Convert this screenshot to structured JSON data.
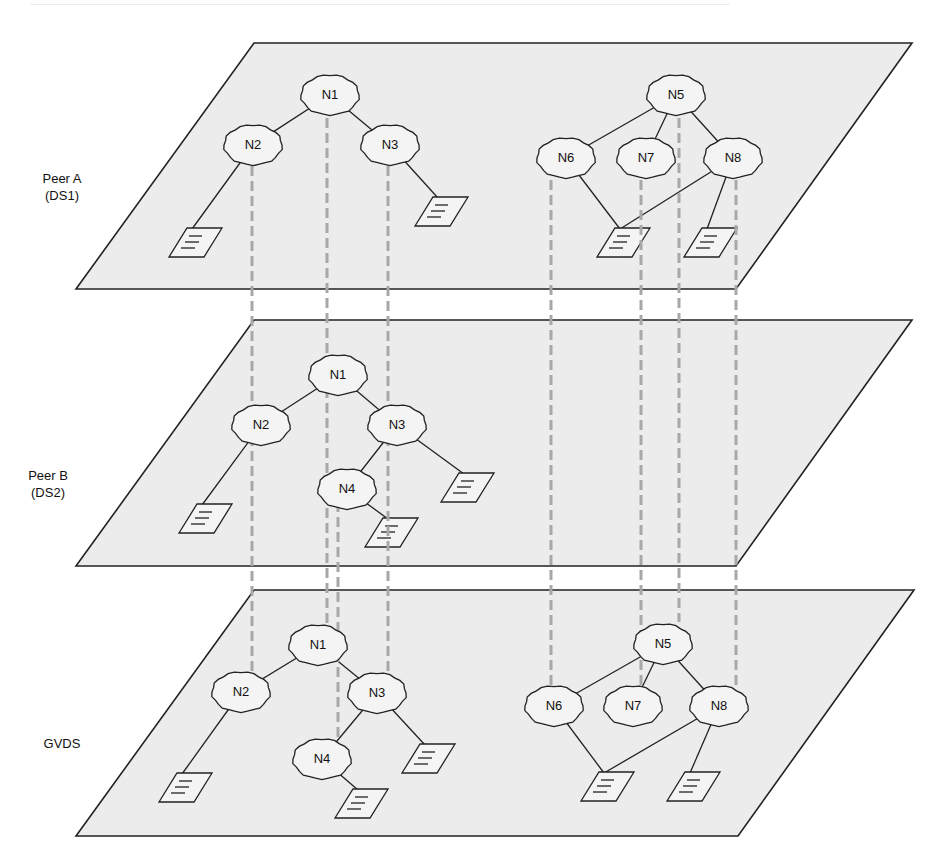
{
  "layers": [
    {
      "id": "peerA",
      "label_line1": "Peer A",
      "label_line2": "(DS1)",
      "plane": {
        "top": 43,
        "bottom": 289,
        "top_left": 254,
        "top_right": 912,
        "bottom_left": 76,
        "bottom_right": 736
      },
      "nodes": [
        {
          "id": "N1",
          "label": "N1",
          "x": 330,
          "y": 95
        },
        {
          "id": "N2",
          "label": "N2",
          "x": 253,
          "y": 145
        },
        {
          "id": "N3",
          "label": "N3",
          "x": 390,
          "y": 145
        },
        {
          "id": "N5",
          "label": "N5",
          "x": 676,
          "y": 95
        },
        {
          "id": "N6",
          "label": "N6",
          "x": 566,
          "y": 158
        },
        {
          "id": "N7",
          "label": "N7",
          "x": 646,
          "y": 158
        },
        {
          "id": "N8",
          "label": "N8",
          "x": 733,
          "y": 158
        }
      ],
      "docs": [
        {
          "x": 188,
          "y": 242
        },
        {
          "x": 434,
          "y": 211
        },
        {
          "x": 616,
          "y": 242
        },
        {
          "x": 703,
          "y": 242
        }
      ],
      "edges": [
        [
          "N1",
          "N2"
        ],
        [
          "N1",
          "N3"
        ],
        [
          "N5",
          "N6"
        ],
        [
          "N5",
          "N7"
        ],
        [
          "N5",
          "N8"
        ]
      ],
      "doc_edges": [
        {
          "from": "N2",
          "doc": 0
        },
        {
          "from": "N3",
          "doc": 1
        },
        {
          "from": "N6",
          "doc": 2
        },
        {
          "from": "N8",
          "doc": 2
        },
        {
          "from": "N8",
          "doc": 3
        }
      ]
    },
    {
      "id": "peerB",
      "label_line1": "Peer B",
      "label_line2": "(DS2)",
      "plane": {
        "top": 320,
        "bottom": 566,
        "top_left": 254,
        "top_right": 912,
        "bottom_left": 76,
        "bottom_right": 736
      },
      "nodes": [
        {
          "id": "N1",
          "label": "N1",
          "x": 338,
          "y": 375
        },
        {
          "id": "N2",
          "label": "N2",
          "x": 261,
          "y": 425
        },
        {
          "id": "N3",
          "label": "N3",
          "x": 397,
          "y": 425
        },
        {
          "id": "N4",
          "label": "N4",
          "x": 347,
          "y": 489
        }
      ],
      "docs": [
        {
          "x": 198,
          "y": 518
        },
        {
          "x": 460,
          "y": 487
        },
        {
          "x": 384,
          "y": 532
        }
      ],
      "edges": [
        [
          "N1",
          "N2"
        ],
        [
          "N1",
          "N3"
        ],
        [
          "N3",
          "N4"
        ]
      ],
      "doc_edges": [
        {
          "from": "N2",
          "doc": 0
        },
        {
          "from": "N3",
          "doc": 1
        },
        {
          "from": "N4",
          "doc": 2
        }
      ]
    },
    {
      "id": "gvds",
      "label_line1": "GVDS",
      "label_line2": "",
      "plane": {
        "top": 590,
        "bottom": 836,
        "top_left": 254,
        "top_right": 914,
        "bottom_left": 76,
        "bottom_right": 738
      },
      "nodes": [
        {
          "id": "N1",
          "label": "N1",
          "x": 318,
          "y": 645
        },
        {
          "id": "N2",
          "label": "N2",
          "x": 241,
          "y": 692
        },
        {
          "id": "N3",
          "label": "N3",
          "x": 377,
          "y": 693
        },
        {
          "id": "N4",
          "label": "N4",
          "x": 322,
          "y": 759
        },
        {
          "id": "N5",
          "label": "N5",
          "x": 663,
          "y": 644
        },
        {
          "id": "N6",
          "label": "N6",
          "x": 554,
          "y": 706
        },
        {
          "id": "N7",
          "label": "N7",
          "x": 633,
          "y": 706
        },
        {
          "id": "N8",
          "label": "N8",
          "x": 719,
          "y": 706
        }
      ],
      "docs": [
        {
          "x": 178,
          "y": 787
        },
        {
          "x": 421,
          "y": 758
        },
        {
          "x": 354,
          "y": 803
        },
        {
          "x": 600,
          "y": 786
        },
        {
          "x": 686,
          "y": 786
        }
      ],
      "edges": [
        [
          "N1",
          "N2"
        ],
        [
          "N1",
          "N3"
        ],
        [
          "N3",
          "N4"
        ],
        [
          "N5",
          "N6"
        ],
        [
          "N5",
          "N7"
        ],
        [
          "N5",
          "N8"
        ]
      ],
      "doc_edges": [
        {
          "from": "N2",
          "doc": 0
        },
        {
          "from": "N3",
          "doc": 1
        },
        {
          "from": "N4",
          "doc": 2
        },
        {
          "from": "N6",
          "doc": 3
        },
        {
          "from": "N8",
          "doc": 3
        },
        {
          "from": "N8",
          "doc": 4
        }
      ]
    }
  ],
  "mapping_lines": [
    {
      "x": 252,
      "y1": 166,
      "y2": 692
    },
    {
      "x": 327,
      "y1": 118,
      "y2": 625
    },
    {
      "x": 388,
      "y1": 166,
      "y2": 674
    },
    {
      "x": 338,
      "y1": 502,
      "y2": 742
    },
    {
      "x": 551,
      "y1": 180,
      "y2": 690
    },
    {
      "x": 641,
      "y1": 180,
      "y2": 685
    },
    {
      "x": 679,
      "y1": 118,
      "y2": 622
    },
    {
      "x": 736,
      "y1": 180,
      "y2": 687
    }
  ],
  "layer_labels": [
    {
      "line1": "Peer A",
      "line2": "(DS1)",
      "x": 33,
      "y": 179
    },
    {
      "line1": "Peer B",
      "line2": "(DS2)",
      "x": 20,
      "y": 477
    },
    {
      "line1": "GVDS",
      "line2": "",
      "x": 34,
      "y": 738
    }
  ]
}
